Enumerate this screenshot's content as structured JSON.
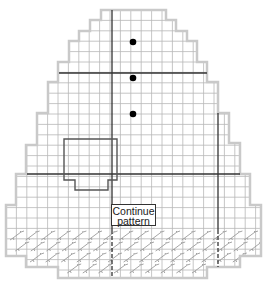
{
  "diagram": {
    "type": "knitting-chart",
    "colors": {
      "grid": "#b8b8b8",
      "outline": "#c9c9c9",
      "thick_line": "#333333",
      "pocket": "#555555",
      "dot": "#000000",
      "cable": "#9a9a9a"
    },
    "cell": 10.4,
    "origin_x": 6,
    "outline_points": [
      [
        101,
        10
      ],
      [
        166,
        10
      ],
      [
        166,
        20
      ],
      [
        176,
        20
      ],
      [
        176,
        31
      ],
      [
        187,
        31
      ],
      [
        187,
        41
      ],
      [
        197,
        41
      ],
      [
        197,
        62
      ],
      [
        207,
        62
      ],
      [
        207,
        82
      ],
      [
        218,
        82
      ],
      [
        218,
        113
      ],
      [
        229,
        113
      ],
      [
        229,
        143
      ],
      [
        240,
        143
      ],
      [
        240,
        174
      ],
      [
        250,
        174
      ],
      [
        250,
        205
      ],
      [
        261,
        205
      ],
      [
        261,
        256
      ],
      [
        240,
        256
      ],
      [
        240,
        267
      ],
      [
        207,
        267
      ],
      [
        207,
        278
      ],
      [
        58,
        278
      ],
      [
        58,
        267
      ],
      [
        26,
        267
      ],
      [
        26,
        256
      ],
      [
        6,
        256
      ],
      [
        6,
        205
      ],
      [
        16,
        205
      ],
      [
        16,
        174
      ],
      [
        26,
        174
      ],
      [
        26,
        145
      ],
      [
        37,
        145
      ],
      [
        37,
        113
      ],
      [
        48,
        113
      ],
      [
        48,
        82
      ],
      [
        58,
        82
      ],
      [
        58,
        62
      ],
      [
        69,
        62
      ],
      [
        69,
        41
      ],
      [
        79,
        41
      ],
      [
        79,
        31
      ],
      [
        90,
        31
      ],
      [
        90,
        20
      ],
      [
        101,
        20
      ]
    ],
    "thick_lines": [
      {
        "x1": 112,
        "y1": 10,
        "x2": 112,
        "y2": 230
      },
      {
        "x1": 59,
        "y1": 73,
        "x2": 207,
        "y2": 73
      },
      {
        "x1": 27,
        "y1": 174,
        "x2": 240,
        "y2": 174
      },
      {
        "x1": 218,
        "y1": 113,
        "x2": 218,
        "y2": 230
      }
    ],
    "dashed_lines": [
      {
        "x1": 112,
        "y1": 230,
        "x2": 112,
        "y2": 278
      },
      {
        "x1": 218,
        "y1": 230,
        "x2": 218,
        "y2": 267
      }
    ],
    "pocket_points": [
      [
        64,
        139
      ],
      [
        117,
        139
      ],
      [
        117,
        180
      ],
      [
        108,
        180
      ],
      [
        108,
        190
      ],
      [
        75,
        190
      ],
      [
        75,
        180
      ],
      [
        64,
        180
      ]
    ],
    "dots": [
      [
        133,
        42
      ],
      [
        133,
        78
      ],
      [
        133,
        114
      ]
    ],
    "cable_rows": [
      {
        "y": 232,
        "x_start": 10,
        "x_end": 258
      },
      {
        "y": 243,
        "x_start": 10,
        "x_end": 258
      },
      {
        "y": 254,
        "x_start": 30,
        "x_end": 238
      },
      {
        "y": 265,
        "x_start": 62,
        "x_end": 205
      }
    ],
    "label": {
      "line1": "Continue",
      "line2": "pattern",
      "x": 111,
      "y": 204,
      "w": 45,
      "h": 22
    }
  }
}
